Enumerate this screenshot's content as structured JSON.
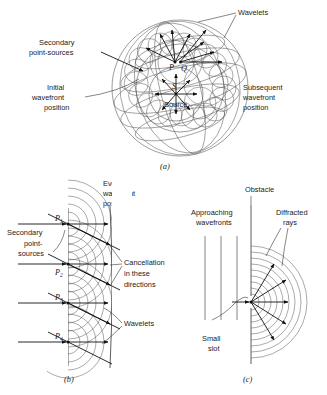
{
  "figure": {
    "panels": [
      {
        "id": "a",
        "panel_label": "(a)",
        "labels": {
          "wavelets": "Wavelets",
          "secondary_point_sources": [
            "Secondary",
            "point-sources"
          ],
          "initial_wavefront_position": [
            "Initial",
            "wavefront",
            "position"
          ],
          "subsequent_wavefront_position": [
            "Subsequent",
            "wavefront",
            "position"
          ],
          "source": "Source",
          "point_p": "P",
          "point_q": "Q",
          "point_s": "S"
        }
      },
      {
        "id": "b",
        "panel_label": "(b)",
        "labels": {
          "initial_wavefront_position": [
            "Initial",
            "wavefront",
            "position"
          ],
          "eventual_wavefront_position": [
            "Eventual",
            "wavefront",
            "position"
          ],
          "secondary_point_sources": [
            "Secondary",
            "point-",
            "sources"
          ],
          "cancellation": [
            "Cancellation",
            "in these",
            "directions"
          ],
          "wavelets": "Wavelets",
          "points": [
            "P",
            "P",
            "P",
            "P"
          ],
          "point_subscripts": [
            "1",
            "2",
            "3",
            "4"
          ]
        }
      },
      {
        "id": "c",
        "panel_label": "(c)",
        "labels": {
          "obstacle": "Obstacle",
          "approaching_wavefronts": [
            "Approaching",
            "wavefronts"
          ],
          "diffracted_rays": [
            "Diffracted",
            "rays"
          ],
          "small_slot": [
            "Small",
            "slot"
          ]
        }
      }
    ],
    "colors": {
      "ink": "#1a1a1a",
      "wavefront_line": "#4a4a4a",
      "background": "#ffffff"
    }
  }
}
